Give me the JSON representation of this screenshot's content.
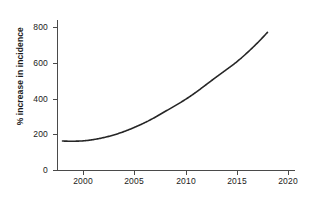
{
  "chart_data": {
    "type": "line",
    "title": "",
    "subtitle": "",
    "xlabel": "",
    "ylabel": "% increase in incidence",
    "xlim": [
      1997.5,
      2021.0
    ],
    "ylim": [
      0,
      830
    ],
    "grid": false,
    "legend": false,
    "x_ticks": [
      2000,
      2005,
      2010,
      2015,
      2020
    ],
    "x_tick_labels": [
      "2000",
      "2005",
      "2010",
      "2015",
      "2020"
    ],
    "y_ticks": [
      0,
      200,
      400,
      600,
      800
    ],
    "y_tick_labels": [
      "0",
      "200",
      "400",
      "600",
      "800"
    ],
    "series": [
      {
        "name": "% increase in incidence",
        "color": "#262626",
        "line_width": 1.6,
        "x": [
          1998,
          1999,
          2000,
          2001,
          2002,
          2003,
          2004,
          2005,
          2006,
          2007,
          2008,
          2009,
          2010,
          2011,
          2012,
          2013,
          2014,
          2015,
          2016,
          2017,
          2018
        ],
        "values": [
          162,
          161,
          163,
          170,
          181,
          196,
          215,
          238,
          264,
          294,
          327,
          360,
          395,
          434,
          477,
          520,
          562,
          605,
          655,
          710,
          770
        ]
      }
    ],
    "annotations": []
  },
  "axes": {
    "y_title": "% increase in incidence",
    "y_tick_labels": [
      "800",
      "600",
      "400",
      "200",
      "0"
    ],
    "x_tick_labels": [
      "2000",
      "2005",
      "2010",
      "2015",
      "2020"
    ],
    "axis_color": "#4a4a4a",
    "text_color": "#1a1a1a"
  }
}
